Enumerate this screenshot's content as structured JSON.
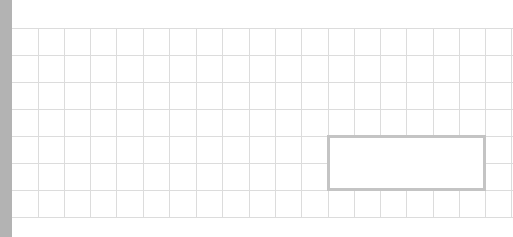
{
  "canvas": {
    "width": 513,
    "height": 237,
    "background": "#ffffff"
  },
  "left_strip": {
    "width": 12,
    "color": "#b3b3b3"
  },
  "grid": {
    "line_color": "#dcdcdc",
    "top": 28,
    "bottom": 217,
    "horizontal_lines_y": [
      28,
      55,
      82,
      109,
      136,
      163,
      190,
      217
    ],
    "vertical_lines_x": [
      38,
      64,
      90,
      116,
      143,
      169,
      196,
      222,
      249,
      275,
      301,
      328,
      354,
      380,
      406,
      433,
      459,
      485,
      511
    ]
  },
  "highlight_rect": {
    "x": 327,
    "y": 135,
    "width": 159,
    "height": 56,
    "border_color": "#c4c4c4",
    "border_width": 3
  }
}
